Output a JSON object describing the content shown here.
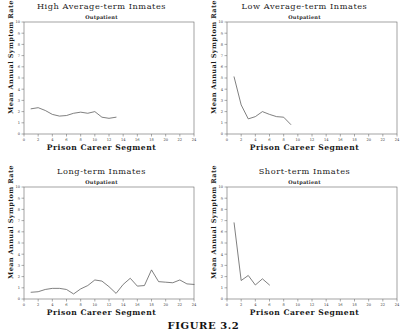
{
  "figure": {
    "caption": "FIGURE 3.2",
    "axis_labels": {
      "x": "Prison Career Segment",
      "y": "Mean Annual Symptom Rate"
    },
    "subtitle": "Outpatient",
    "colors": {
      "line": "#555555",
      "axis": "#666666",
      "text": "#1a1a1a",
      "background": "#ffffff"
    }
  },
  "chart_data": [
    {
      "type": "line",
      "title": "High Average-term Inmates",
      "subtitle": "Outpatient",
      "xlabel": "Prison Career Segment",
      "ylabel": "Mean Annual Symptom Rate",
      "xlim": [
        0,
        24
      ],
      "ylim": [
        0,
        10
      ],
      "xticks": [
        0,
        2,
        4,
        6,
        8,
        10,
        12,
        14,
        16,
        18,
        20,
        22,
        24
      ],
      "yticks": [
        0,
        1,
        2,
        3,
        4,
        5,
        6,
        7,
        8,
        9,
        10
      ],
      "grid": false,
      "legend": "none",
      "x": [
        1,
        2,
        3,
        4,
        5,
        6,
        7,
        8,
        9,
        10,
        11,
        12,
        13
      ],
      "values": [
        2.25,
        2.35,
        2.1,
        1.75,
        1.6,
        1.65,
        1.85,
        1.95,
        1.85,
        2.0,
        1.5,
        1.4,
        1.5
      ]
    },
    {
      "type": "line",
      "title": "Low Average-term Inmates",
      "subtitle": "Outpatient",
      "xlabel": "Prison Career Segment",
      "ylabel": "Mean Annual Symptom Rate",
      "xlim": [
        0,
        24
      ],
      "ylim": [
        0,
        10
      ],
      "xticks": [
        0,
        2,
        4,
        6,
        8,
        10,
        12,
        14,
        16,
        18,
        20,
        22,
        24
      ],
      "yticks": [
        0,
        1,
        2,
        3,
        4,
        5,
        6,
        7,
        8,
        9,
        10
      ],
      "grid": false,
      "legend": "none",
      "x": [
        1,
        2,
        3,
        4,
        5,
        6,
        7,
        8,
        9
      ],
      "values": [
        5.1,
        2.6,
        1.35,
        1.55,
        2.0,
        1.75,
        1.55,
        1.5,
        0.85
      ]
    },
    {
      "type": "line",
      "title": "Long-term Inmates",
      "subtitle": "Outpatient",
      "xlabel": "Prison Career Segment",
      "ylabel": "Mean Annual Symptom Rate",
      "xlim": [
        0,
        24
      ],
      "ylim": [
        0,
        10
      ],
      "xticks": [
        0,
        2,
        4,
        6,
        8,
        10,
        12,
        14,
        16,
        18,
        20,
        22,
        24
      ],
      "yticks": [
        0,
        1,
        2,
        3,
        4,
        5,
        6,
        7,
        8,
        9,
        10
      ],
      "grid": false,
      "legend": "none",
      "x": [
        1,
        2,
        3,
        4,
        5,
        6,
        7,
        8,
        9,
        10,
        11,
        12,
        13,
        14,
        15,
        16,
        17,
        18,
        19,
        20,
        21,
        22,
        23,
        24
      ],
      "values": [
        0.6,
        0.65,
        0.85,
        0.95,
        0.95,
        0.85,
        0.45,
        0.9,
        1.2,
        1.7,
        1.6,
        1.1,
        0.5,
        1.3,
        1.85,
        1.15,
        1.2,
        2.6,
        1.55,
        1.5,
        1.45,
        1.7,
        1.35,
        1.3,
        1.4
      ]
    },
    {
      "type": "line",
      "title": "Short-term Inmates",
      "subtitle": "Outpatient",
      "xlabel": "Prison Career Segment",
      "ylabel": "Mean Annual Symptom Rate",
      "xlim": [
        0,
        24
      ],
      "ylim": [
        0,
        10
      ],
      "xticks": [
        0,
        2,
        4,
        6,
        8,
        10,
        12,
        14,
        16,
        18,
        20,
        22,
        24
      ],
      "yticks": [
        0,
        1,
        2,
        3,
        4,
        5,
        6,
        7,
        8,
        9,
        10
      ],
      "grid": false,
      "legend": "none",
      "x": [
        1,
        2,
        3,
        4,
        5,
        6
      ],
      "values": [
        6.8,
        1.65,
        2.1,
        1.25,
        1.8,
        1.25
      ]
    }
  ]
}
